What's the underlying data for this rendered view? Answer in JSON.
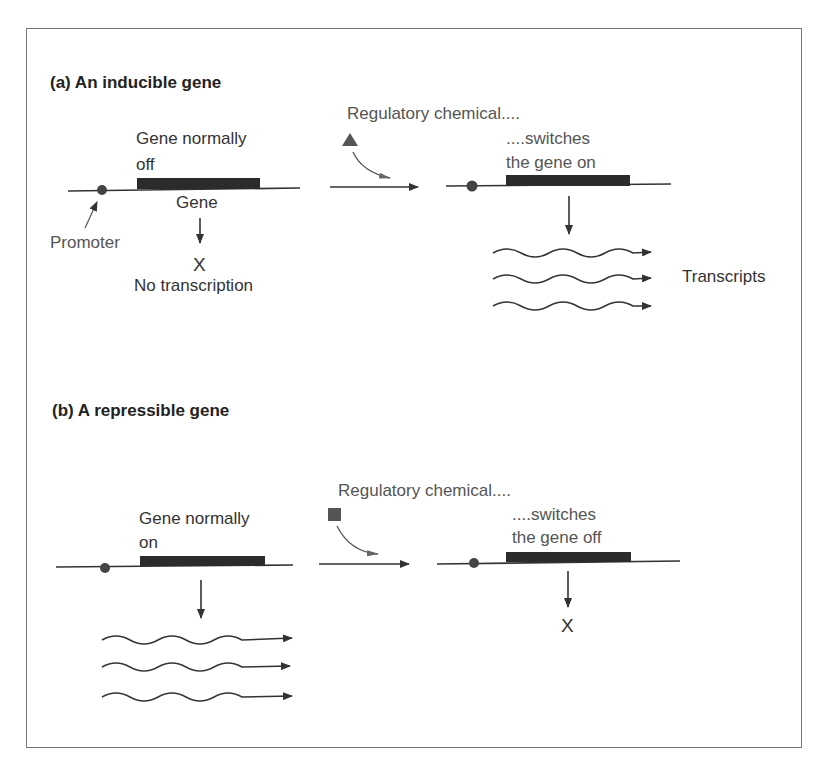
{
  "figure": {
    "panel_a": {
      "title": "(a)  An inducible gene",
      "gene_state_line1": "Gene normally",
      "gene_state_line2": "off",
      "gene_label": "Gene",
      "promoter_label": "Promoter",
      "no_transcription_mark": "X",
      "no_transcription_label": "No transcription",
      "regulator_label": "Regulatory chemical....",
      "regulator_shape": "triangle",
      "effect_line1": "....switches",
      "effect_line2": "the gene on",
      "transcripts_label": "Transcripts"
    },
    "panel_b": {
      "title": "(b)  A repressible gene",
      "gene_state_line1": "Gene normally",
      "gene_state_line2": "on",
      "regulator_label": "Regulatory chemical....",
      "regulator_shape": "square",
      "effect_line1": "....switches",
      "effect_line2": "the gene off",
      "no_transcription_mark": "X"
    },
    "colors": {
      "line": "#2a2a2a",
      "gene_block": "#2b2b2b",
      "regulator": "#555555",
      "frame": "#777777"
    }
  }
}
